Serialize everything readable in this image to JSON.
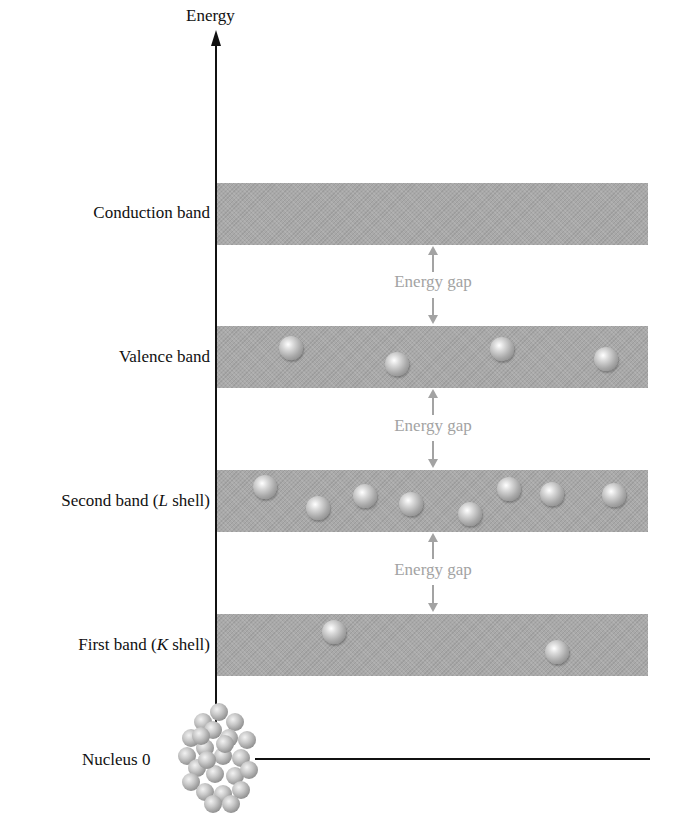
{
  "axis": {
    "y_label": "Energy",
    "origin_label": "Nucleus 0"
  },
  "bands": [
    {
      "id": "conduction",
      "label": "Conduction band",
      "label_parts": [
        "Conduction band"
      ],
      "electrons": 0
    },
    {
      "id": "valence",
      "label": "Valence band",
      "label_parts": [
        "Valence band"
      ],
      "electrons": 4
    },
    {
      "id": "second",
      "label": "Second band (L shell)",
      "label_prefix": "Second band (",
      "label_italic": "L",
      "label_suffix": " shell)",
      "electrons": 8
    },
    {
      "id": "first",
      "label": "First band (K shell)",
      "label_prefix": "First band (",
      "label_italic": "K",
      "label_suffix": " shell)",
      "electrons": 2
    }
  ],
  "gaps": [
    {
      "label": "Energy gap",
      "between": [
        "conduction",
        "valence"
      ]
    },
    {
      "label": "Energy gap",
      "between": [
        "valence",
        "second"
      ]
    },
    {
      "label": "Energy gap",
      "between": [
        "second",
        "first"
      ]
    }
  ],
  "colors": {
    "band": "#a9a9a9",
    "gap_text": "#a3a3a3",
    "axis": "#111111"
  }
}
